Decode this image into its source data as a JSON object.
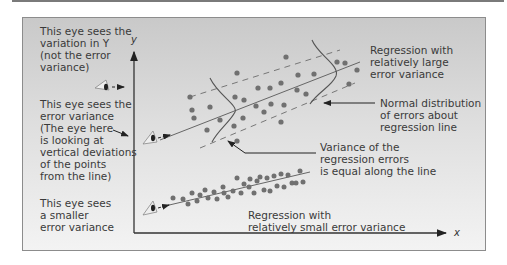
{
  "figure": {
    "type": "diagram",
    "colors": {
      "panel_top": "#c9c9c9",
      "panel_bottom": "#f3f3f3",
      "ink": "#3a3a3a",
      "dot": "#707070"
    },
    "axes": {
      "x_label": "x",
      "y_label": "y"
    },
    "left_notes": [
      {
        "text": "This eye sees the\nvariation in Y\n(not the error\nvariance)"
      },
      {
        "text": "This eye sees the\nerror variance\n(The eye here\nis looking at\nvertical deviations\nof the points\nfrom the line)"
      },
      {
        "text": "This eye sees\na smaller\nerror variance"
      }
    ],
    "callouts": {
      "large_regression": "Regression with\nrelatively large\nerror variance",
      "normal_distribution": "Normal distribution\nof errors about\nregression line",
      "equal_variance": "Variance of the\nregression errors\nis equal along the line",
      "small_regression": "Regression with\nrelatively small error variance"
    },
    "icons": [
      "eye-icon-top",
      "eye-icon-middle",
      "eye-icon-bottom"
    ]
  }
}
